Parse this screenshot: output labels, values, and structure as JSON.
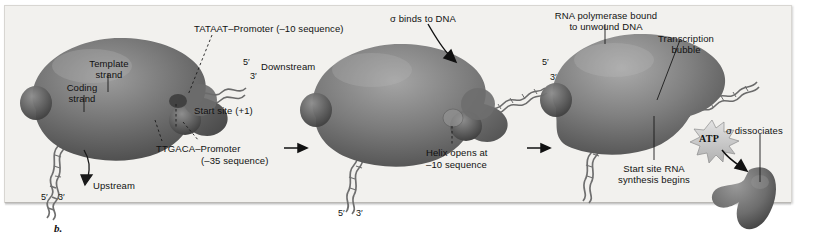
{
  "figure": {
    "caption_label": "b.",
    "panel_count": 3
  },
  "colors": {
    "panel_bg": "#f2f1ee",
    "protein_dark": "#4a4a4a",
    "protein_mid": "#7c7c7c",
    "protein_light": "#a8a8a8",
    "dna_strand": "#6b6b6b",
    "text": "#111111",
    "label_highlight": "#d6d4cf",
    "atp_burst": "#c9c9c9"
  },
  "panel1": {
    "labels": {
      "tataat_box": "TATAAT",
      "tataat_rest": "–Promoter (–10 sequence)",
      "template_strand": "Template\nstrand",
      "template_strand_l1": "Template",
      "template_strand_l2": "strand",
      "coding_strand_l1": "Coding",
      "coding_strand_l2": "strand",
      "downstream": "Downstream",
      "start_site": "Start site (+1)",
      "ttgaca_box": "TTGACA",
      "ttgaca_rest": "–Promoter",
      "ttgaca_l2": "(–35 sequence)",
      "upstream": "Upstream",
      "five_prime_right": "5′",
      "three_prime_right": "3′",
      "five_prime_left": "5′",
      "three_prime_left": "3′"
    }
  },
  "panel2": {
    "labels": {
      "sigma_binds": "σ binds to DNA",
      "helix_opens_l1": "Helix opens at",
      "helix_opens_l2": "–10 sequence",
      "five_prime_right": "5′",
      "three_prime_right": "3′",
      "five_prime_left": "5′",
      "three_prime_left": "3′"
    }
  },
  "panel3": {
    "labels": {
      "rnap_bound_l1": "RNA polymerase bound",
      "rnap_bound_l2": "to unwound DNA",
      "transcription_bubble_l1": "Transcription",
      "transcription_bubble_l2": "bubble",
      "sigma_dissociates": "σ dissociates",
      "start_site_rna_l1": "Start site RNA",
      "start_site_rna_l2": "synthesis begins",
      "atp": "ATP"
    }
  },
  "transitions": {
    "arrow1": "→",
    "arrow2": "→"
  }
}
